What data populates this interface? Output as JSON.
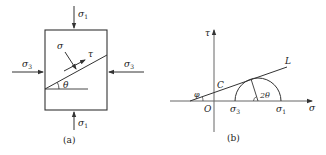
{
  "panel_a": {
    "caption": "(a)",
    "top_load": "σ",
    "top_load_sub": "1",
    "bottom_load": "σ",
    "bottom_load_sub": "1",
    "left_load": "σ",
    "left_load_sub": "3",
    "right_load": "σ",
    "right_load_sub": "3",
    "normal_stress": "σ",
    "shear_stress": "τ",
    "angle": "θ"
  },
  "panel_b": {
    "caption": "(b)",
    "tau_axis": "τ",
    "sigma_axis": "σ",
    "origin": "O",
    "cohesion": "C",
    "friction_angle": "φ",
    "envelope": "L",
    "sigma3": "σ",
    "sigma3_sub": "3",
    "sigma1": "σ",
    "sigma1_sub": "1",
    "double_angle": "2θ"
  },
  "colors": {
    "stroke": "#333333",
    "background": "#ffffff"
  }
}
